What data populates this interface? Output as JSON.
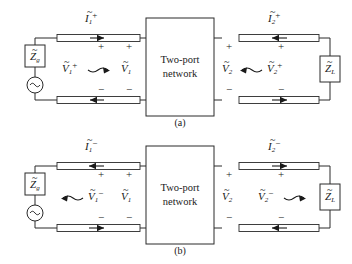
{
  "figure": {
    "background_color": "#ffffff",
    "line_color": "#2b2b2b",
    "text_color": "#1a1a1a",
    "network_box_label_line1": "Two-port",
    "network_box_label_line2": "network",
    "plus_sign": "+",
    "minus_sign": "−",
    "tilde_accent": "~",
    "source_symbol": "∿"
  },
  "panels": [
    {
      "id": "a",
      "caption": "(a)",
      "source_impedance": {
        "symbol": "Z",
        "subscript": "g"
      },
      "load_impedance": {
        "symbol": "Z",
        "subscript": "L"
      },
      "labels": {
        "current_left": {
          "symbol": "I",
          "subscript": "1",
          "superscript": "+"
        },
        "current_right": {
          "symbol": "I",
          "subscript": "2",
          "superscript": "+"
        },
        "voltage_wave_left": {
          "symbol": "V",
          "subscript": "1",
          "superscript": "+"
        },
        "voltage_port_left": {
          "symbol": "V",
          "subscript": "1",
          "superscript": ""
        },
        "voltage_port_right": {
          "symbol": "V",
          "subscript": "2",
          "superscript": ""
        },
        "voltage_wave_right": {
          "symbol": "V",
          "subscript": "2",
          "superscript": "+"
        }
      },
      "wave_arrow_left_direction": "right",
      "wave_arrow_right_direction": "left",
      "line_arrows": {
        "top_left": "right",
        "bottom_left": "left",
        "top_right": "left",
        "bottom_right": "right"
      }
    },
    {
      "id": "b",
      "caption": "(b)",
      "source_impedance": {
        "symbol": "Z",
        "subscript": "g"
      },
      "load_impedance": {
        "symbol": "Z",
        "subscript": "L"
      },
      "labels": {
        "current_left": {
          "symbol": "I",
          "subscript": "1",
          "superscript": "−"
        },
        "current_right": {
          "symbol": "I",
          "subscript": "2",
          "superscript": "−"
        },
        "voltage_wave_left": {
          "symbol": "V",
          "subscript": "1",
          "superscript": "−"
        },
        "voltage_port_left": {
          "symbol": "V",
          "subscript": "1",
          "superscript": ""
        },
        "voltage_port_right": {
          "symbol": "V",
          "subscript": "2",
          "superscript": ""
        },
        "voltage_wave_right": {
          "symbol": "V",
          "subscript": "2",
          "superscript": "−"
        }
      },
      "wave_arrow_left_direction": "left",
      "wave_arrow_right_direction": "right",
      "line_arrows": {
        "top_left": "left",
        "bottom_left": "right",
        "top_right": "right",
        "bottom_right": "left"
      }
    }
  ]
}
